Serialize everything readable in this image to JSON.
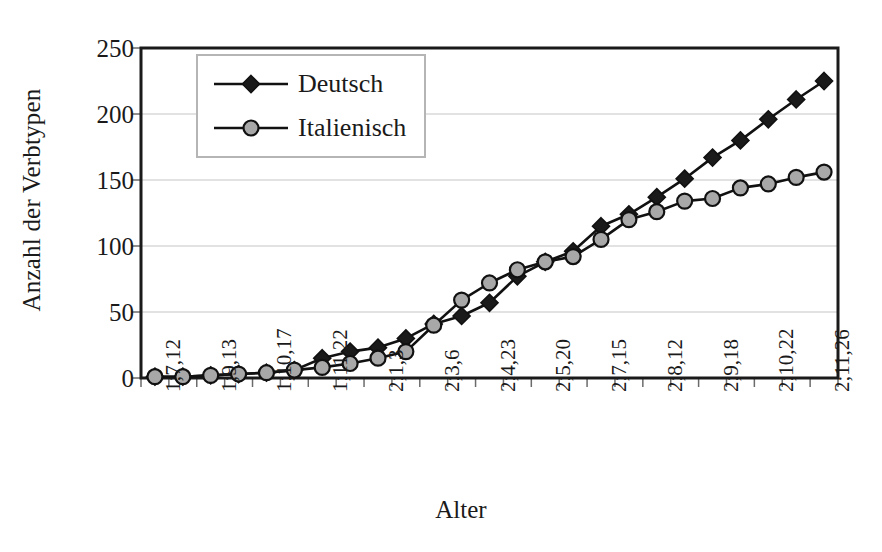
{
  "chart_data": {
    "type": "line",
    "title": "",
    "xlabel": "Alter",
    "ylabel": "Anzahl der Verbtypen",
    "ylim": [
      0,
      250
    ],
    "yticks": [
      0,
      50,
      100,
      150,
      200,
      250
    ],
    "grid": true,
    "legend_position": "top-left-inside",
    "categories": [
      "1;7,12",
      "1;8,0",
      "1;9,13",
      "1;10,0",
      "1;10,17",
      "1;11,0",
      "1;11,22",
      "2;0,15",
      "2;1,3",
      "2;2,0",
      "2;3,6",
      "2;3,25",
      "2;4,23",
      "2;5,5",
      "2;5,20",
      "2;6,15",
      "2;7,15",
      "2;7,28",
      "2;8,12",
      "2;8,28",
      "2;9,18",
      "2;10,5",
      "2;10,22",
      "2;11,8",
      "2;11,26"
    ],
    "tick_labels_shown": [
      "1;7,12",
      "1;9,13",
      "1;10,17",
      "1;11,22",
      "2;1,3",
      "2;3,6",
      "2;4,23",
      "2;5,20",
      "2;7,15",
      "2;8,12",
      "2;9,18",
      "2;10,22",
      "2;11,26"
    ],
    "series": [
      {
        "name": "Deutsch",
        "marker": "diamond",
        "color": "#1a1a1a",
        "values": [
          1,
          1,
          2,
          3,
          4,
          6,
          15,
          20,
          23,
          30,
          41,
          47,
          57,
          77,
          88,
          96,
          115,
          124,
          137,
          151,
          167,
          180,
          196,
          211,
          225
        ]
      },
      {
        "name": "Italienisch",
        "marker": "circle",
        "color": "#a8a8a8",
        "values": [
          1,
          1,
          2,
          3,
          4,
          6,
          8,
          11,
          15,
          20,
          40,
          59,
          72,
          82,
          88,
          92,
          105,
          120,
          126,
          134,
          136,
          144,
          147,
          152,
          156
        ]
      }
    ]
  },
  "legend": {
    "entries": [
      {
        "label": "Deutsch"
      },
      {
        "label": "Italienisch"
      }
    ]
  },
  "axis": {
    "y_title": "Anzahl der Verbtypen",
    "x_title": "Alter",
    "y_tick_labels": [
      "250",
      "200",
      "150",
      "100",
      "50",
      "0"
    ]
  }
}
